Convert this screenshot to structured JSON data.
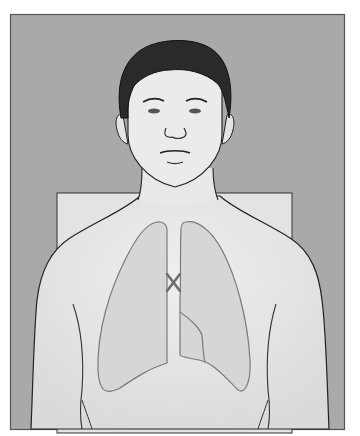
{
  "figure": {
    "marker": {
      "glyph": "X",
      "location": "trachea / sternal notch region"
    },
    "colors": {
      "frame_bg": "#a9a9a9",
      "frame_border": "#555555",
      "back_panel": "#e3e3e3",
      "skin": "#e8e8e8",
      "skin_shade": "#d8d8d8",
      "lung_fill": "#d6d6d6",
      "lung_stroke": "#7a7a7a",
      "hair": "#2a2a2a",
      "outline": "#222222",
      "marker": "#6e6e6e"
    }
  }
}
